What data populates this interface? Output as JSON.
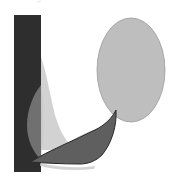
{
  "artwork": {
    "type": "abstract-shapes-composition",
    "palette": {
      "background": "#ffffff",
      "rectangle": "#2e2e2e",
      "sliver": "#d2d2d2",
      "left_leaf": "#707070",
      "ellipse_fill": "#bebebe",
      "ellipse_stroke": "#9a9a9a",
      "boat_fill": "#5f5f5f",
      "boat_stroke": "#2a2a2a",
      "shadow": "#b5b5b5"
    },
    "shapes": [
      {
        "name": "dark-vertical-rectangle"
      },
      {
        "name": "light-curved-sliver"
      },
      {
        "name": "medium-gray-leaf"
      },
      {
        "name": "light-gray-ellipse"
      },
      {
        "name": "dark-boat-shape"
      }
    ]
  }
}
